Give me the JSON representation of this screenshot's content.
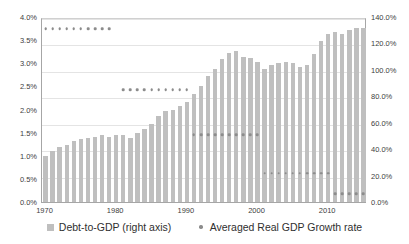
{
  "chart_data": {
    "type": "bar",
    "title": "",
    "xlabel": "",
    "ylabel": "",
    "grid": true,
    "legend_position": "bottom",
    "x": [
      1970,
      1971,
      1972,
      1973,
      1974,
      1975,
      1976,
      1977,
      1978,
      1979,
      1980,
      1981,
      1982,
      1983,
      1984,
      1985,
      1986,
      1987,
      1988,
      1989,
      1990,
      1991,
      1992,
      1993,
      1994,
      1995,
      1996,
      1997,
      1998,
      1999,
      2000,
      2001,
      2002,
      2003,
      2004,
      2005,
      2006,
      2007,
      2008,
      2009,
      2010,
      2011,
      2012,
      2013,
      2014,
      2015
    ],
    "xtick_labels": [
      "1970",
      "1980",
      "1990",
      "2000",
      "2010"
    ],
    "xtick_values": [
      1970,
      1980,
      1990,
      2000,
      2010
    ],
    "left_axis": {
      "name": "Averaged Real GDP Growth rate",
      "ylim": [
        0.0,
        4.0
      ],
      "tick_labels": [
        "0.0%",
        "0.5%",
        "1.0%",
        "1.5%",
        "2.0%",
        "2.5%",
        "3.0%",
        "3.5%",
        "4.0%"
      ],
      "tick_values": [
        0.0,
        0.5,
        1.0,
        1.5,
        2.0,
        2.5,
        3.0,
        3.5,
        4.0
      ]
    },
    "right_axis": {
      "name": "Debt-to-GDP (right axis)",
      "ylim": [
        0.0,
        140.0
      ],
      "tick_labels": [
        "0.0%",
        "20.0%",
        "40.0%",
        "60.0%",
        "80.0%",
        "100.0%",
        "120.0%",
        "140.0%"
      ],
      "tick_values": [
        0.0,
        20.0,
        40.0,
        60.0,
        80.0,
        100.0,
        120.0,
        140.0
      ]
    },
    "series": [
      {
        "name": "Debt-to-GDP (right axis)",
        "type": "bar",
        "axis": "right",
        "color": "#bfbfbf",
        "values": [
          35.0,
          38.5,
          41.5,
          43.5,
          46.0,
          47.5,
          48.5,
          49.5,
          51.0,
          49.5,
          50.5,
          50.5,
          48.5,
          52.0,
          55.0,
          59.0,
          65.0,
          68.5,
          70.0,
          72.5,
          76.0,
          82.0,
          88.0,
          95.0,
          101.0,
          108.0,
          113.0,
          114.0,
          110.0,
          109.0,
          106.0,
          101.0,
          103.5,
          105.0,
          106.0,
          105.0,
          102.0,
          104.0,
          112.0,
          122.0,
          127.0,
          128.5,
          127.5,
          130.0,
          131.5,
          131.5
        ]
      },
      {
        "name": "Averaged Real GDP Growth rate",
        "type": "scatter",
        "axis": "left",
        "color": "#8c8c8c",
        "decade_averages": [
          {
            "decade": "1970s",
            "start_year": 1970,
            "end_year": 1979,
            "value": 3.75
          },
          {
            "decade": "1980s",
            "start_year": 1981,
            "end_year": 1990,
            "value": 2.42
          },
          {
            "decade": "1990s",
            "start_year": 1991,
            "end_year": 2000,
            "value": 1.45
          },
          {
            "decade": "2000s",
            "start_year": 2001,
            "end_year": 2010,
            "value": 0.62
          },
          {
            "decade": "2010s",
            "start_year": 2011,
            "end_year": 2015,
            "value": 0.18
          }
        ]
      }
    ]
  },
  "legend": {
    "items": [
      {
        "label": "Debt-to-GDP (right axis)",
        "marker": "square",
        "color": "#bfbfbf"
      },
      {
        "label": "Averaged Real GDP Growth rate",
        "marker": "dot",
        "color": "#8c8c8c"
      }
    ]
  }
}
